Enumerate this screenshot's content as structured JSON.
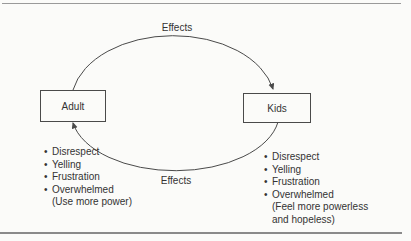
{
  "page": {
    "background": "#fbfbf9"
  },
  "cycle": {
    "top_arrow_label": "Effects",
    "bottom_arrow_label": "Effects",
    "adult_box_label": "Adult",
    "kids_box_label": "Kids",
    "bullet": "•",
    "adult_effects": {
      "items": [
        "Disrespect",
        "Yelling",
        "Frustration",
        "Overwhelmed"
      ],
      "note": "(Use more power)"
    },
    "kids_effects": {
      "items": [
        "Disrespect",
        "Yelling",
        "Frustration",
        "Overwhelmed"
      ],
      "note_line1": "(Feel more powerless",
      "note_line2": "and hopeless)"
    },
    "colors": {
      "line": "#4a4a4a",
      "text": "#333333",
      "rule_top": "#9a9a9a",
      "rule_bottom": "#8a8a8a"
    }
  }
}
